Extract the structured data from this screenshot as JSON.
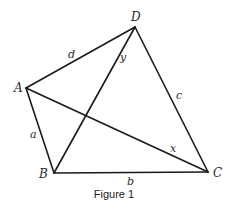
{
  "figure": {
    "caption": "Figure 1",
    "stroke_color": "#1a1a1a",
    "vertices": {
      "A": {
        "label": "A",
        "x": 26,
        "y": 88,
        "label_x": 14,
        "label_y": 92
      },
      "B": {
        "label": "B",
        "x": 54,
        "y": 173,
        "label_x": 39,
        "label_y": 178
      },
      "C": {
        "label": "C",
        "x": 208,
        "y": 172,
        "label_x": 213,
        "label_y": 177
      },
      "D": {
        "label": "D",
        "x": 135,
        "y": 27,
        "label_x": 131,
        "label_y": 21
      }
    },
    "segments": [
      {
        "from": "A",
        "to": "D",
        "label": "d",
        "label_x": 68,
        "label_y": 58
      },
      {
        "from": "A",
        "to": "B",
        "label": "a",
        "label_x": 30,
        "label_y": 138
      },
      {
        "from": "B",
        "to": "C",
        "label": "b",
        "label_x": 127,
        "label_y": 185
      },
      {
        "from": "C",
        "to": "D",
        "label": "c",
        "label_x": 176,
        "label_y": 99
      },
      {
        "from": "A",
        "to": "C",
        "label": "x",
        "label_x": 170,
        "label_y": 152
      },
      {
        "from": "B",
        "to": "D",
        "label": "y",
        "label_x": 120,
        "label_y": 61
      }
    ]
  }
}
